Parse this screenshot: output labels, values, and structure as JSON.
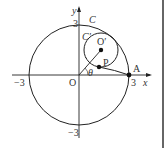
{
  "diagram": {
    "type": "geometry",
    "axes": {
      "x_label": "x",
      "y_label": "y",
      "origin_label": "O"
    },
    "ticks": {
      "x_neg": "−3",
      "x_pos": "3",
      "y_pos": "3",
      "y_neg": "−3"
    },
    "labels": {
      "big_circle": "C",
      "small_circle": "C′",
      "small_center": "O′",
      "point_p": "P",
      "point_a": "A",
      "angle": "θ"
    },
    "colors": {
      "stroke": "#222222",
      "background": "#ffffff",
      "border": "#666666"
    }
  }
}
